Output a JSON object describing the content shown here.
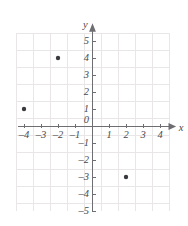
{
  "figure": {
    "background_color": "#ffffff",
    "width": 188,
    "height": 226
  },
  "chart_data": {
    "type": "scatter",
    "title": "",
    "xlabel": "x",
    "ylabel": "y",
    "xlim": [
      -4.6,
      4.6
    ],
    "ylim": [
      -5.2,
      5.6
    ],
    "grid": true,
    "grid_color": "#e8e6e6",
    "axis_color": "#6e6e72",
    "point_color": "#3a3a3e",
    "legend": null,
    "origin_label": "0",
    "xticks": [
      -4,
      -3,
      -2,
      -1,
      1,
      2,
      3,
      4
    ],
    "xtick_labels": [
      "–4",
      "–3",
      "–2",
      "–1",
      "1",
      "2",
      "3",
      "4"
    ],
    "yticks": [
      5,
      4,
      3,
      2,
      1,
      -1,
      -2,
      -3,
      -4,
      -5
    ],
    "ytick_labels": [
      "5",
      "4",
      "3",
      "2",
      "1",
      "–1",
      "–2",
      "–3",
      "–4",
      "–5"
    ],
    "points": [
      {
        "x": -4,
        "y": 1,
        "label": "(–4, 1)"
      },
      {
        "x": -2,
        "y": 4,
        "label": "(–2, 4)"
      },
      {
        "x": 2,
        "y": -3,
        "label": "(2, –3)"
      }
    ],
    "series": [
      {
        "name": "plotted points",
        "x": [
          -4,
          -2,
          2
        ],
        "y": [
          1,
          4,
          -3
        ]
      }
    ]
  }
}
